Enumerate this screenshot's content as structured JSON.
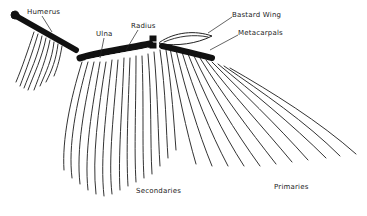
{
  "diagram": {
    "labels": {
      "humerus": "Humerus",
      "ulna": "Ulna",
      "radius": "Radius",
      "bastard_wing": "Bastard Wing",
      "metacarpals": "Metacarpals",
      "secondaries": "Secondaries",
      "primaries": "Primaries"
    },
    "colors": {
      "bone": "#111111",
      "feather_stroke": "#333333",
      "text": "#222222",
      "background": "#ffffff"
    }
  }
}
